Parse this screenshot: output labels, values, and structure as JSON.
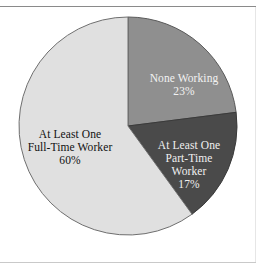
{
  "figure": {
    "background_color": "#ffffff",
    "rule_color": "#8a8a8a"
  },
  "chart_data": {
    "type": "pie",
    "title": "",
    "subtitle": "",
    "xlabel": "",
    "ylabel": "",
    "legend_position": "none",
    "grid": false,
    "labels_inside_slices": true,
    "start_angle_deg": 0,
    "direction": "clockwise",
    "categories": [
      "None Working",
      "At Least One Part-Time Worker",
      "At Least One Full-Time Worker"
    ],
    "values": [
      23,
      17,
      60
    ],
    "value_suffix": "%",
    "slices": [
      {
        "name": "none-working",
        "label_lines": [
          "None Working"
        ],
        "value": 23,
        "value_label": "23%",
        "color": "#8f8f8f",
        "text_color": "#f2f2f2"
      },
      {
        "name": "at-least-one-part-time-worker",
        "label_lines": [
          "At Least One",
          "Part-Time",
          "Worker"
        ],
        "value": 17,
        "value_label": "17%",
        "color": "#4a4a4a",
        "text_color": "#f0f0f0"
      },
      {
        "name": "at-least-one-full-time-worker",
        "label_lines": [
          "At Least One",
          "Full-Time Worker"
        ],
        "value": 60,
        "value_label": "60%",
        "color": "#e0e0e0",
        "text_color": "#111111"
      }
    ]
  },
  "labels": {
    "none_working": {
      "line1": "None Working",
      "percent": "23%"
    },
    "part_time": {
      "line1": "At Least One",
      "line2": "Part-Time",
      "line3": "Worker",
      "percent": "17%"
    },
    "full_time": {
      "line1": "At Least One",
      "line2": "Full-Time Worker",
      "percent": "60%"
    }
  }
}
